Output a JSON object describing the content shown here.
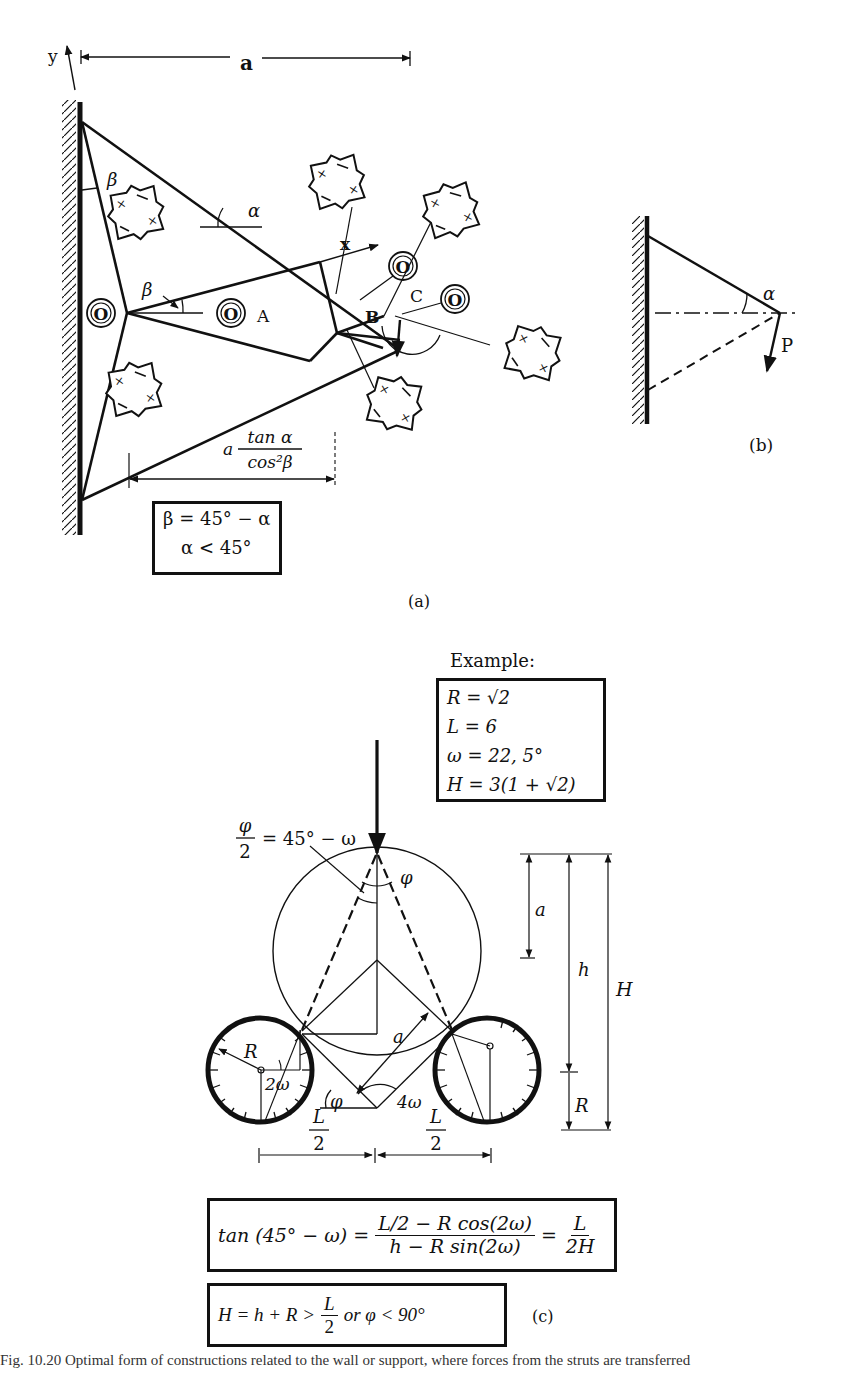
{
  "figure_a": {
    "panel_label": "(a)",
    "axis_y": "y",
    "axis_x": "x",
    "dimension_top": "a",
    "angle_alpha": "α",
    "angle_beta_top": "β",
    "angle_beta_mid": "β",
    "node_left": "O",
    "node_mid": "O",
    "node_right_upper": "O",
    "node_right": "O",
    "region_A": "A",
    "region_B": "B",
    "region_C": "C",
    "dimension_bottom_coef": "a",
    "dimension_bottom_num": "tan α",
    "dimension_bottom_den": "cos²β",
    "conditions": [
      "β = 45° − α",
      "α < 45°"
    ]
  },
  "figure_b": {
    "panel_label": "(b)",
    "angle_alpha": "α",
    "force": "P"
  },
  "figure_c": {
    "panel_label": "(c)",
    "example_title": "Example:",
    "example_values": [
      "R = √2",
      "L = 6",
      "ω = 22, 5°",
      "H = 3(1 + √2)"
    ],
    "half_angle_num": "φ",
    "half_angle_den": "2",
    "half_angle_rhs": "= 45° − ω",
    "angle_phi_top": "φ",
    "angle_phi_bottom": "φ",
    "dim_a_right": "a",
    "dim_a_diag": "a",
    "dim_h": "h",
    "dim_H": "H",
    "dim_R_right": "R",
    "radius_R": "R",
    "angle_2w": "2ω",
    "angle_4w": "4ω",
    "half_L_left_num": "L",
    "half_L_left_den": "2",
    "half_L_right_num": "L",
    "half_L_right_den": "2",
    "equation1": {
      "lhs": "tan (45° − ω) =",
      "mid_num": "L/2 − R cos(2ω)",
      "mid_den": "h − R sin(2ω)",
      "eq": "=",
      "rhs_num": "L",
      "rhs_den": "2H"
    },
    "equation2": {
      "lhs": "H = h + R >",
      "frac_num": "L",
      "frac_den": "2",
      "rhs": "or φ < 90°"
    }
  },
  "caption": "Fig. 10.20  Optimal form of constructions related to the wall or support, where forces from the struts are transferred"
}
